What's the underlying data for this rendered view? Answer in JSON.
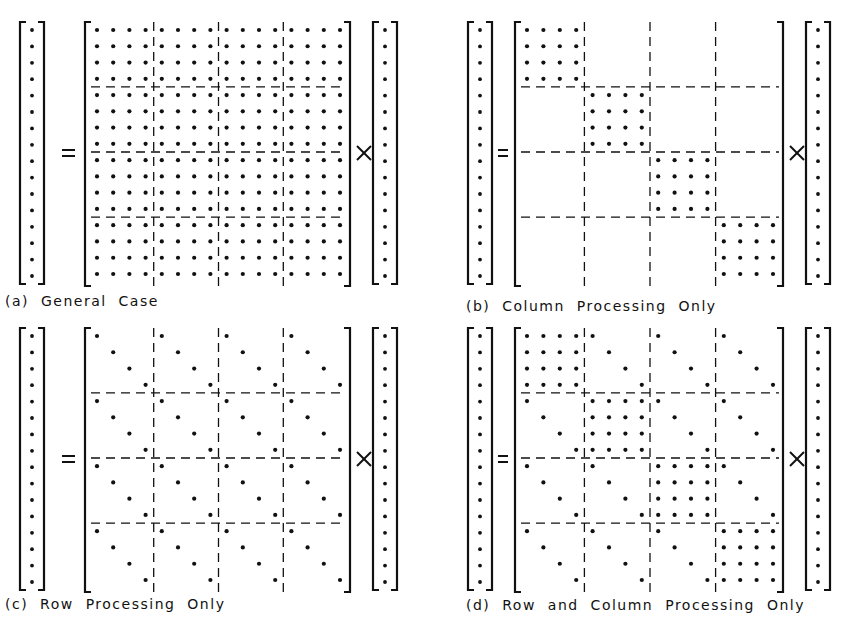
{
  "panels": [
    {
      "id": "a",
      "caption": "(a) General Case",
      "pattern": "full",
      "origin": {
        "x": 20,
        "y": 22
      },
      "layout": "wide",
      "caption_pos": {
        "x": 5,
        "y": 293
      }
    },
    {
      "id": "b",
      "caption": "(b) Column Processing Only",
      "pattern": "block-diagonal",
      "origin": {
        "x": 468,
        "y": 22
      },
      "layout": "narrow",
      "caption_pos": {
        "x": 466,
        "y": 298
      }
    },
    {
      "id": "c",
      "caption": "(c) Row Processing Only",
      "pattern": "diagonal-in-each-block",
      "origin": {
        "x": 20,
        "y": 328
      },
      "layout": "wide",
      "caption_pos": {
        "x": 5,
        "y": 596
      }
    },
    {
      "id": "d",
      "caption": "(d) Row and Column Processing Only",
      "pattern": "block-diagonal-plus-diagonals",
      "origin": {
        "x": 468,
        "y": 328
      },
      "layout": "narrow",
      "caption_pos": {
        "x": 466,
        "y": 597
      }
    }
  ],
  "matrix": {
    "size": 16,
    "block_size": 4
  },
  "symbols": {
    "equals": "=",
    "times": "×"
  },
  "colors": {
    "ink": "#111111",
    "background": "#ffffff"
  }
}
